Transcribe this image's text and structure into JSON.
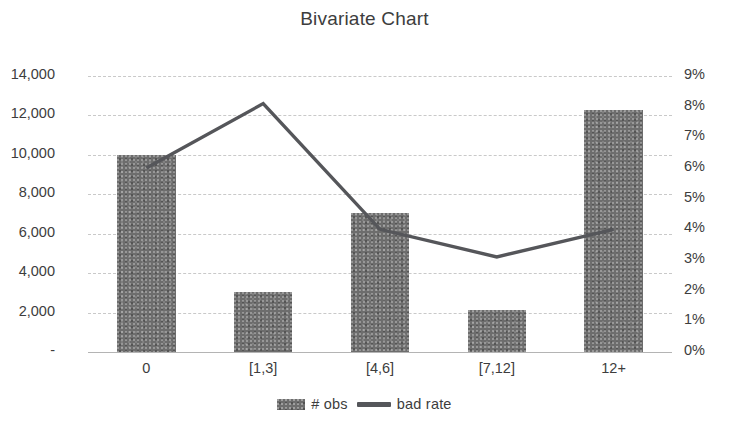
{
  "chart_data": {
    "type": "bar",
    "title": "Bivariate Chart",
    "xlabel": "",
    "ylabel": "",
    "categories": [
      "0",
      "[1,3]",
      "[4,6]",
      "[7,12]",
      "12+"
    ],
    "series": [
      {
        "name": "#  obs",
        "type": "bar",
        "axis": "left",
        "values": [
          10000,
          3050,
          7050,
          2150,
          12300
        ]
      },
      {
        "name": "bad rate",
        "type": "line",
        "axis": "right",
        "values": [
          0.06,
          0.081,
          0.04,
          0.031,
          0.04
        ]
      }
    ],
    "left_axis": {
      "ticks": [
        "-",
        "2,000",
        "4,000",
        "6,000",
        "8,000",
        "10,000",
        "12,000",
        "14,000"
      ],
      "tick_values": [
        0,
        2000,
        4000,
        6000,
        8000,
        10000,
        12000,
        14000
      ],
      "ylim": [
        0,
        14000
      ]
    },
    "right_axis": {
      "ticks": [
        "0%",
        "1%",
        "2%",
        "3%",
        "4%",
        "5%",
        "6%",
        "7%",
        "8%",
        "9%"
      ],
      "tick_values": [
        0,
        1,
        2,
        3,
        4,
        5,
        6,
        7,
        8,
        9
      ],
      "ylim": [
        0,
        9
      ]
    },
    "grid": true,
    "legend_position": "bottom",
    "colors": {
      "bar": "#6d6d6d",
      "line": "#55565a",
      "grid": "#c9c9c9",
      "axis": "#b4b4b4",
      "text": "#3d3d3d",
      "background": "#ffffff"
    }
  },
  "legend": {
    "entries": [
      {
        "label": "#  obs",
        "marker": "bar-swatch-icon"
      },
      {
        "label": "bad rate",
        "marker": "line-swatch-icon"
      }
    ]
  }
}
